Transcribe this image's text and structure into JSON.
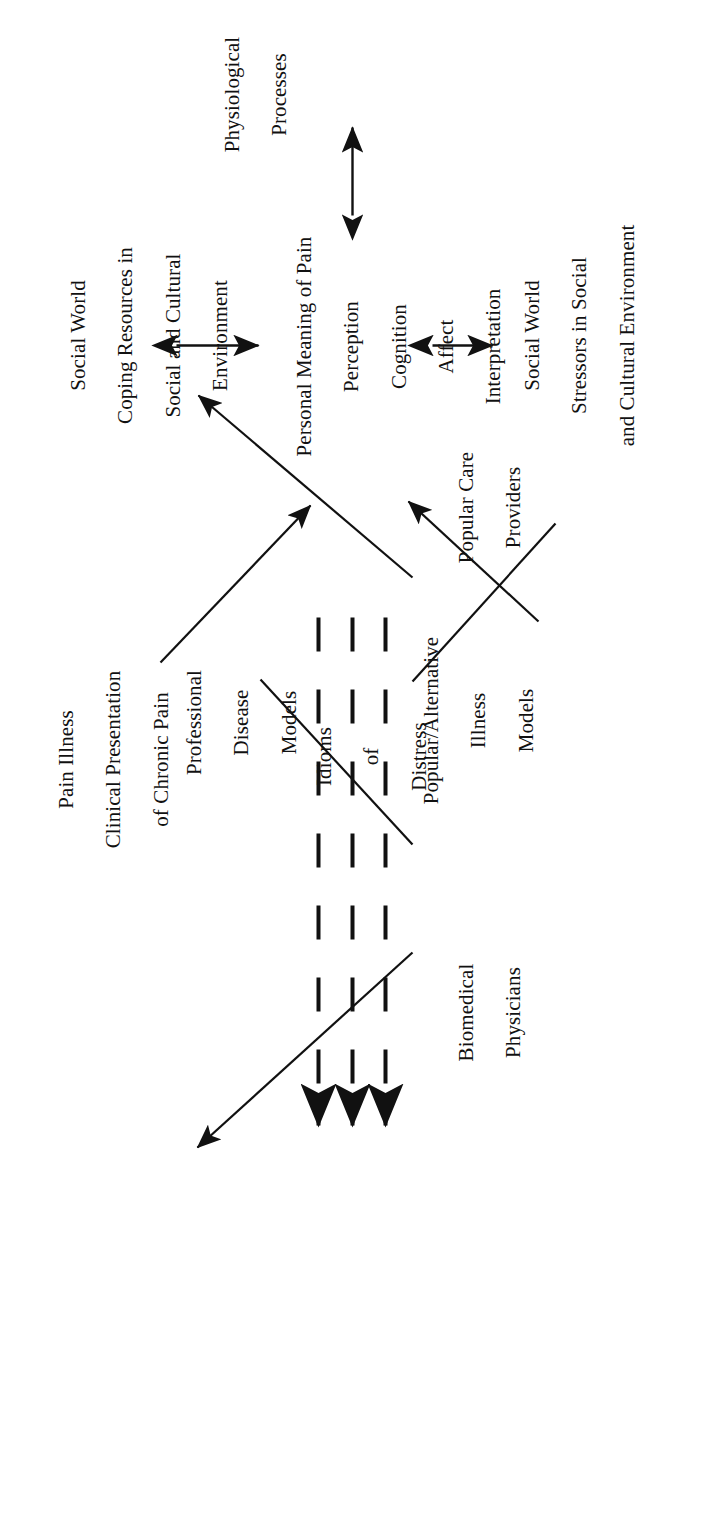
{
  "figure": {
    "type": "conceptual-flow-diagram",
    "orientation": "rotated-90-counterclockwise",
    "background_color": "#ffffff",
    "ink_color": "#111111"
  },
  "nodes": {
    "pain_illness": {
      "name": "pain-illness",
      "lines": [
        "Pain Illness",
        "Clinical Presentation",
        "of Chronic Pain"
      ]
    },
    "biomedical_physicians": {
      "name": "biomedical-physicians",
      "lines": [
        "Biomedical",
        "Physicians"
      ]
    },
    "popular_care_providers": {
      "name": "popular-care-providers",
      "lines": [
        "Popular Care",
        "Providers"
      ]
    },
    "professional_disease_models": {
      "name": "professional-disease-models",
      "lines": [
        "Professional",
        "Disease",
        "Models"
      ]
    },
    "popular_alternative_illness_models": {
      "name": "popular-alternative-illness-models",
      "lines": [
        "Popular/Alternative",
        "Illness",
        "Models"
      ]
    },
    "idioms_of_distress": {
      "name": "idioms-of-distress",
      "lines": [
        "Idioms",
        "of",
        "Distress"
      ]
    },
    "personal_meaning_of_pain": {
      "name": "personal-meaning-of-pain",
      "lines": [
        "Personal Meaning of Pain",
        "Perception",
        "Cognition",
        "Affect",
        "Interpretation"
      ]
    },
    "social_world_coping": {
      "name": "social-world-coping-resources",
      "lines": [
        "Social World",
        "Coping Resources in",
        "Social and Cultural",
        "Environment"
      ]
    },
    "social_world_stressors": {
      "name": "social-world-stressors",
      "lines": [
        "Social World",
        "Stressors in Social",
        "and Cultural Environment"
      ]
    },
    "physiological_processes": {
      "name": "physiological-processes",
      "lines": [
        "Physiological",
        "Processes"
      ]
    }
  },
  "edges": [
    {
      "name": "edge-biomedical-to-pain-illness",
      "style": "solid-arrow",
      "from": "biomedical_physicians",
      "to": "pain_illness"
    },
    {
      "name": "edge-popular-care-to-pain-illness",
      "style": "solid-arrow",
      "from": "popular_care_providers",
      "to": "pain_illness"
    },
    {
      "name": "edge-biomedical-to-professional-models",
      "style": "solid-line",
      "from": "biomedical_physicians",
      "to": "professional_disease_models"
    },
    {
      "name": "edge-popular-care-to-popular-models",
      "style": "solid-line",
      "from": "popular_care_providers",
      "to": "popular_alternative_illness_models"
    },
    {
      "name": "edge-professional-models-to-personal-meaning",
      "style": "solid-arrow",
      "from": "professional_disease_models",
      "to": "personal_meaning_of_pain"
    },
    {
      "name": "edge-popular-models-to-personal-meaning",
      "style": "solid-arrow",
      "from": "popular_alternative_illness_models",
      "to": "personal_meaning_of_pain"
    },
    {
      "name": "edge-idioms-of-distress-upper",
      "style": "dashed-arrow",
      "count": 3,
      "from": "personal_meaning_of_pain",
      "to": "pain_illness"
    },
    {
      "name": "edge-coping-to-personal-meaning",
      "style": "solid-double-arrow",
      "from": "social_world_coping",
      "to": "personal_meaning_of_pain"
    },
    {
      "name": "edge-personal-meaning-to-stressors",
      "style": "solid-double-arrow",
      "from": "personal_meaning_of_pain",
      "to": "social_world_stressors"
    },
    {
      "name": "edge-personal-meaning-to-physiological",
      "style": "solid-double-arrow",
      "from": "personal_meaning_of_pain",
      "to": "physiological_processes"
    }
  ]
}
